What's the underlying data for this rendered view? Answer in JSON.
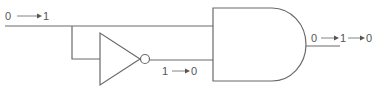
{
  "diagram": {
    "type": "logic-circuit",
    "components": [
      {
        "id": "inverter",
        "kind": "NOT gate"
      },
      {
        "id": "and_gate",
        "kind": "AND gate"
      }
    ],
    "labels": {
      "input": {
        "from": "0",
        "to": "1"
      },
      "inverter_output": {
        "from": "1",
        "to": "0"
      },
      "gate_output": {
        "from": "0",
        "mid": "1",
        "to": "0"
      }
    },
    "colors": {
      "line": "#6a6a6a",
      "text": "#555555",
      "background": "#ffffff"
    }
  }
}
